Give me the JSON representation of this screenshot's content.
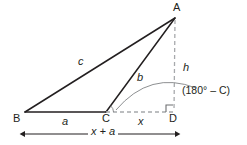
{
  "figure": {
    "colors": {
      "stroke_solid": "#231f20",
      "stroke_dashed": "#a7a9ac",
      "stroke_arc": "#6d6e71",
      "text": "#231f20",
      "background": "#ffffff"
    }
  },
  "vertices": [
    {
      "id": "A",
      "label": "A",
      "x": 175,
      "y": 18
    },
    {
      "id": "B",
      "label": "B",
      "x": 25,
      "y": 112
    },
    {
      "id": "C",
      "label": "C",
      "x": 106,
      "y": 112
    },
    {
      "id": "D",
      "label": "D",
      "x": 173,
      "y": 112
    }
  ],
  "vertex_labels": [
    {
      "name": "vertex-label-a",
      "text": "A",
      "left": 173,
      "top": 2
    },
    {
      "name": "vertex-label-b",
      "text": "B",
      "left": 13,
      "top": 113
    },
    {
      "name": "vertex-label-c",
      "text": "C",
      "left": 102,
      "top": 113
    },
    {
      "name": "vertex-label-d",
      "text": "D",
      "left": 169,
      "top": 113
    }
  ],
  "side_labels": [
    {
      "name": "side-label-c",
      "text": "c",
      "left": 78,
      "top": 56
    },
    {
      "name": "side-label-b",
      "text": "b",
      "left": 137,
      "top": 72
    },
    {
      "name": "side-label-h",
      "text": "h",
      "left": 183,
      "top": 62
    },
    {
      "name": "side-label-a",
      "text": "a",
      "left": 62,
      "top": 116
    },
    {
      "name": "side-label-x",
      "text": "x",
      "left": 138,
      "top": 116
    }
  ],
  "angle_label": {
    "name": "exterior-angle-label",
    "text": "(180° – C)",
    "left": 182,
    "top": 85
  },
  "dimension": {
    "name": "overall-width-dimension",
    "label": "x + a",
    "label_left": 88,
    "label_top": 126,
    "x_start": 25,
    "x_end": 175,
    "y": 134
  },
  "segments": [
    {
      "name": "segment-ba",
      "from": "B",
      "to": "A",
      "style": "solid",
      "label": "c"
    },
    {
      "name": "segment-bc",
      "from": "B",
      "to": "C",
      "style": "solid",
      "label": "a"
    },
    {
      "name": "segment-ca",
      "from": "C",
      "to": "A",
      "style": "solid",
      "label": "b"
    },
    {
      "name": "segment-cd",
      "from": "C",
      "to": "D",
      "style": "dashed",
      "label": "x"
    },
    {
      "name": "segment-ad",
      "from": "A",
      "to": "D",
      "style": "dashed",
      "label": "h"
    }
  ],
  "markers": {
    "right_angle": {
      "name": "right-angle-marker-d",
      "at": "D",
      "size": 7
    },
    "angle_tick": {
      "name": "interior-angle-tick-c",
      "at": "C"
    },
    "exterior_arc": {
      "name": "exterior-angle-arc",
      "from": "C",
      "to": "AD"
    }
  }
}
